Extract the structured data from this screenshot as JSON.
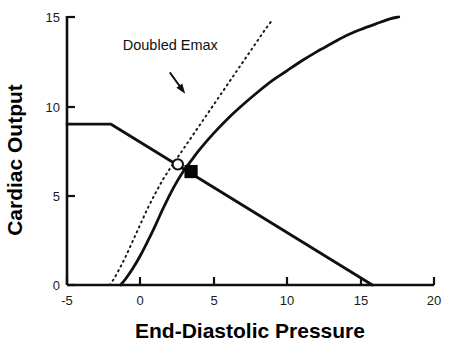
{
  "chart_data": {
    "type": "line",
    "title": "",
    "xlabel": "End-Diastolic Pressure",
    "ylabel": "Cardiac Output",
    "xlim": [
      -5,
      20
    ],
    "ylim": [
      0,
      15
    ],
    "xticks": [
      -5,
      0,
      5,
      10,
      15,
      20
    ],
    "yticks": [
      0,
      5,
      10,
      15
    ],
    "xtick_labels": [
      "-5",
      "0",
      "5",
      "10",
      "15",
      "20"
    ],
    "ytick_labels": [
      "0",
      "5",
      "10",
      "15"
    ],
    "grid": false,
    "legend": "none",
    "series": [
      {
        "name": "Normal cardiac function curve",
        "style": "solid",
        "color": "#101010",
        "points": [
          [
            -1.35,
            0.0
          ],
          [
            -1.0,
            0.35
          ],
          [
            -0.5,
            0.95
          ],
          [
            0.0,
            1.65
          ],
          [
            0.5,
            2.45
          ],
          [
            1.0,
            3.3
          ],
          [
            1.5,
            4.2
          ],
          [
            2.0,
            5.05
          ],
          [
            2.5,
            5.8
          ],
          [
            3.0,
            6.45
          ],
          [
            3.5,
            7.0
          ],
          [
            4.0,
            7.55
          ],
          [
            5.0,
            8.5
          ],
          [
            6.0,
            9.35
          ],
          [
            7.0,
            10.1
          ],
          [
            8.0,
            10.8
          ],
          [
            9.0,
            11.45
          ],
          [
            10.0,
            12.0
          ],
          [
            11.0,
            12.55
          ],
          [
            12.0,
            13.05
          ],
          [
            13.0,
            13.5
          ],
          [
            14.0,
            13.95
          ],
          [
            15.0,
            14.3
          ],
          [
            16.0,
            14.6
          ],
          [
            17.0,
            14.9
          ],
          [
            17.6,
            15.0
          ]
        ]
      },
      {
        "name": "Doubled Emax cardiac function curve",
        "style": "dotted",
        "color": "#1a1a1a",
        "points": [
          [
            -2.1,
            0.0
          ],
          [
            -1.8,
            0.35
          ],
          [
            -1.4,
            0.95
          ],
          [
            -1.0,
            1.6
          ],
          [
            -0.5,
            2.5
          ],
          [
            0.0,
            3.4
          ],
          [
            0.5,
            4.3
          ],
          [
            1.0,
            5.1
          ],
          [
            1.5,
            5.85
          ],
          [
            2.0,
            6.5
          ],
          [
            2.5,
            7.1
          ],
          [
            3.0,
            7.7
          ],
          [
            3.5,
            8.3
          ],
          [
            4.0,
            8.9
          ],
          [
            4.5,
            9.5
          ],
          [
            5.0,
            10.1
          ],
          [
            5.5,
            10.7
          ],
          [
            6.0,
            11.3
          ],
          [
            6.5,
            11.9
          ],
          [
            7.0,
            12.5
          ],
          [
            7.5,
            13.1
          ],
          [
            8.0,
            13.7
          ],
          [
            8.5,
            14.3
          ],
          [
            9.0,
            14.85
          ]
        ]
      },
      {
        "name": "Venous return curve",
        "style": "solid",
        "color": "#101010",
        "points": [
          [
            -5.0,
            9.0
          ],
          [
            -2.0,
            9.0
          ],
          [
            15.8,
            0.0
          ]
        ]
      }
    ],
    "markers": [
      {
        "name": "Doubled-Emax operating point",
        "shape": "open-circle",
        "x": 2.55,
        "y": 6.75,
        "fill": "#ffffff",
        "stroke": "#101010"
      },
      {
        "name": "Baseline operating point",
        "shape": "filled-square",
        "x": 3.45,
        "y": 6.35,
        "fill": "#050505",
        "stroke": "#050505"
      }
    ],
    "annotations": [
      {
        "name": "doubled-emax-label",
        "text": "Doubled Emax",
        "text_x": -1.2,
        "text_y": 13.15,
        "arrow_from_x": 2.0,
        "arrow_from_y": 11.9,
        "arrow_to_x": 3.05,
        "arrow_to_y": 10.7
      }
    ]
  }
}
